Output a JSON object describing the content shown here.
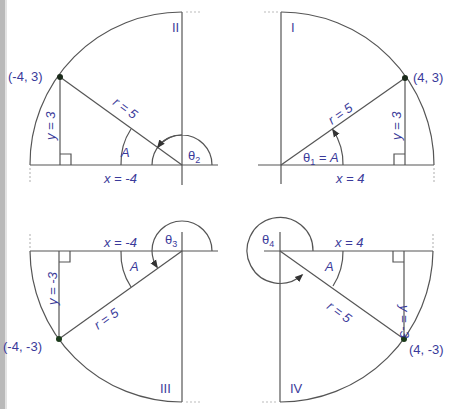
{
  "figure": {
    "colors": {
      "label": "#3a3a9a",
      "line": "#555555",
      "point": "#1a3a1a",
      "left_bar": "#b9b9b9"
    },
    "quadrants": [
      {
        "id": "II",
        "roman": "II",
        "point_label": "(-4, 3)",
        "x_label": "x = -4",
        "y_label": "y = 3",
        "r_label": "r = 5",
        "ref_angle_label": "A",
        "theta_label": "θ",
        "theta_sub": "2"
      },
      {
        "id": "I",
        "roman": "I",
        "point_label": "(4, 3)",
        "x_label": "x = 4",
        "y_label": "y = 3",
        "r_label": "r = 5",
        "theta_label": "θ",
        "theta_sub": "1",
        "theta_suffix": " = A"
      },
      {
        "id": "III",
        "roman": "III",
        "point_label": "(-4, -3)",
        "x_label": "x = -4",
        "y_label": "y = -3",
        "r_label": "r = 5",
        "ref_angle_label": "A",
        "theta_label": "θ",
        "theta_sub": "3"
      },
      {
        "id": "IV",
        "roman": "IV",
        "point_label": "(4, -3)",
        "x_label": "x = 4",
        "y_label": "y = -3",
        "r_label": "r = 5",
        "ref_angle_label": "A",
        "theta_label": "θ",
        "theta_sub": "4"
      }
    ]
  }
}
